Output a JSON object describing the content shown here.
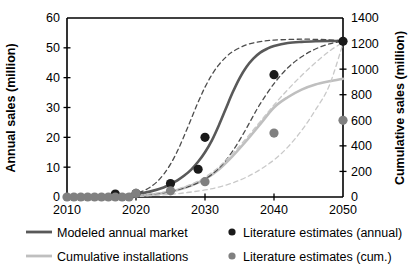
{
  "chart_data": {
    "type": "line",
    "title": "",
    "xlabel": "",
    "ylabel": "Annual sales (million)",
    "y2label": "Cumulative sales (million)",
    "xlim": [
      2010,
      2050
    ],
    "ylim": [
      0,
      60
    ],
    "y2lim": [
      0,
      1400
    ],
    "xticks": [
      2010,
      2020,
      2030,
      2040,
      2050
    ],
    "xtick_labels": [
      "2010",
      "2020",
      "2030",
      "2040",
      "2050"
    ],
    "xminor_ticks": [
      2015,
      2025,
      2035,
      2045
    ],
    "yticks": [
      0,
      10,
      20,
      30,
      40,
      50,
      60
    ],
    "ytick_labels": [
      "0",
      "10",
      "20",
      "30",
      "40",
      "50",
      "60"
    ],
    "y2ticks": [
      0,
      200,
      400,
      600,
      800,
      1000,
      1200,
      1400
    ],
    "y2tick_labels": [
      "0",
      "200",
      "400",
      "600",
      "800",
      "1000",
      "1200",
      "1400"
    ],
    "grid": false,
    "legend_position": "below",
    "series": [
      {
        "name": "Modeled annual market",
        "style": "solid",
        "color": "#595959",
        "width": 2.6,
        "axis": "left",
        "x": [
          2010,
          2012,
          2014,
          2016,
          2018,
          2020,
          2022,
          2024,
          2025,
          2026,
          2027,
          2028,
          2029,
          2030,
          2031,
          2032,
          2033,
          2034,
          2035,
          2036,
          2037,
          2038,
          2039,
          2040,
          2042,
          2044,
          2046,
          2048,
          2050
        ],
        "values": [
          0.1,
          0.15,
          0.2,
          0.3,
          0.5,
          0.9,
          1.8,
          3.2,
          4.3,
          5.6,
          7.2,
          9.2,
          11.8,
          15.0,
          19.0,
          24.0,
          29.5,
          35.0,
          39.8,
          43.6,
          46.4,
          48.4,
          49.7,
          50.6,
          51.6,
          52.0,
          52.2,
          52.3,
          52.3
        ]
      },
      {
        "name": "Cumulative installations",
        "style": "solid",
        "color": "#bfbfbf",
        "width": 2.6,
        "axis": "right",
        "x": [
          2010,
          2014,
          2018,
          2020,
          2022,
          2024,
          2026,
          2028,
          2030,
          2032,
          2034,
          2036,
          2038,
          2040,
          2042,
          2044,
          2046,
          2048,
          2050
        ],
        "values": [
          0,
          2,
          6,
          10,
          18,
          32,
          55,
          90,
          140,
          215,
          320,
          440,
          570,
          700,
          780,
          840,
          880,
          905,
          925
        ]
      },
      {
        "name": "upper-bound-annual",
        "style": "dashed",
        "color": "#4d4d4d",
        "width": 1.3,
        "axis": "left",
        "x": [
          2010,
          2014,
          2018,
          2020,
          2021,
          2022,
          2023,
          2024,
          2025,
          2026,
          2027,
          2028,
          2029,
          2030,
          2031,
          2032,
          2033,
          2034,
          2036,
          2038,
          2040,
          2044,
          2048,
          2050
        ],
        "values": [
          0.1,
          0.3,
          0.7,
          1.3,
          2.0,
          3.2,
          5.0,
          7.6,
          11.0,
          15.4,
          20.6,
          26.2,
          31.8,
          36.8,
          41.0,
          44.3,
          46.8,
          48.7,
          51.0,
          52.1,
          52.6,
          52.9,
          52.7,
          52.3
        ]
      },
      {
        "name": "lower-bound-annual",
        "style": "dashed",
        "color": "#4d4d4d",
        "width": 1.3,
        "axis": "left",
        "x": [
          2010,
          2016,
          2020,
          2024,
          2027,
          2029,
          2030,
          2031,
          2032,
          2033,
          2034,
          2035,
          2036,
          2037,
          2038,
          2040,
          2042,
          2044,
          2046,
          2048,
          2050
        ],
        "values": [
          0.05,
          0.2,
          0.5,
          1.4,
          3.0,
          4.8,
          6.0,
          7.6,
          9.6,
          12.2,
          15.4,
          19.0,
          23.0,
          27.2,
          31.2,
          38.0,
          43.3,
          47.0,
          49.6,
          51.3,
          52.3
        ]
      },
      {
        "name": "upper-bound-cumulative",
        "style": "dashed",
        "color": "#c9c9c9",
        "width": 1.3,
        "axis": "right",
        "x": [
          2010,
          2016,
          2020,
          2024,
          2026,
          2028,
          2030,
          2032,
          2034,
          2036,
          2038,
          2040,
          2042,
          2044,
          2046,
          2048,
          2050
        ],
        "values": [
          0,
          4,
          12,
          38,
          62,
          100,
          155,
          235,
          340,
          460,
          590,
          720,
          840,
          950,
          1050,
          1140,
          1210
        ]
      },
      {
        "name": "lower-bound-cumulative",
        "style": "dashed",
        "color": "#c9c9c9",
        "width": 1.3,
        "axis": "right",
        "x": [
          2010,
          2018,
          2022,
          2026,
          2030,
          2032,
          2034,
          2036,
          2038,
          2040,
          2042,
          2044,
          2046,
          2048,
          2050
        ],
        "values": [
          0,
          3,
          10,
          26,
          55,
          78,
          110,
          155,
          215,
          290,
          390,
          520,
          680,
          870,
          1200
        ]
      }
    ],
    "points": [
      {
        "name": "Literature estimates (annual)",
        "color": "#1a1a1a",
        "axis": "left",
        "radius": 4.6,
        "data": [
          {
            "x": 2017,
            "y": 1.0
          },
          {
            "x": 2020,
            "y": 1.2
          },
          {
            "x": 2025,
            "y": 4.5
          },
          {
            "x": 2029,
            "y": 9.3
          },
          {
            "x": 2030,
            "y": 20.0
          },
          {
            "x": 2040,
            "y": 41.0
          },
          {
            "x": 2050,
            "y": 52.2
          }
        ]
      },
      {
        "name": "Literature estimates (cum.)",
        "color": "#808080",
        "axis": "right",
        "radius": 4.6,
        "data": [
          {
            "x": 2010,
            "y": 0
          },
          {
            "x": 2011,
            "y": 0
          },
          {
            "x": 2012,
            "y": 0
          },
          {
            "x": 2013,
            "y": 0
          },
          {
            "x": 2014,
            "y": 0
          },
          {
            "x": 2015,
            "y": 0
          },
          {
            "x": 2016,
            "y": 0
          },
          {
            "x": 2017,
            "y": 0
          },
          {
            "x": 2018,
            "y": 0
          },
          {
            "x": 2019,
            "y": 0
          },
          {
            "x": 2020,
            "y": 28
          },
          {
            "x": 2025,
            "y": 48
          },
          {
            "x": 2030,
            "y": 120
          },
          {
            "x": 2040,
            "y": 500
          },
          {
            "x": 2050,
            "y": 600
          }
        ]
      }
    ]
  },
  "legend": {
    "items": [
      {
        "label": "Modeled annual market",
        "marker": "line",
        "color": "#595959"
      },
      {
        "label": "Literature estimates (annual)",
        "marker": "dot",
        "color": "#1a1a1a"
      },
      {
        "label": "Cumulative installations",
        "marker": "line",
        "color": "#bfbfbf"
      },
      {
        "label": "Literature estimates (cum.)",
        "marker": "dot",
        "color": "#808080"
      }
    ]
  },
  "colors": {
    "axis": "#000000",
    "background": "#ffffff",
    "annual_solid": "#595959",
    "cumulative_solid": "#bfbfbf",
    "annual_dot": "#1a1a1a",
    "cumulative_dot": "#808080"
  }
}
